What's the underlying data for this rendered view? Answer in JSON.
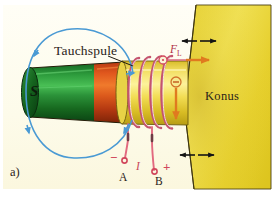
{
  "figure": {
    "panel_label": "a)",
    "background_color": "#fdfcf0",
    "page_color": "#ffffff",
    "caption_text": "Tauchspule im Konus eines Lautsprechers"
  },
  "labels": {
    "coil": "Tauchspule",
    "cone": "Konus",
    "terminal_a": "A",
    "terminal_b": "B",
    "terminal_a_sign": "−",
    "terminal_b_sign": "+",
    "current": "I",
    "force": "F",
    "force_subscript": "L",
    "magnet_pole": "S"
  },
  "colors": {
    "background": "#fdfcf0",
    "cone_yellow": "#ecd834",
    "tube_yellow": "#f0dd55",
    "magnet_green": "#1d7a2c",
    "magnet_green_dark": "#0d4f1a",
    "magnet_red": "#d94a1a",
    "coil_wire": "#d6607a",
    "lead_wire": "#e2697f",
    "field_line_blue": "#4a9ad4",
    "force_arrow_orange": "#e07a1f",
    "force_label_red": "#b13146",
    "motion_arrow_black": "#1a1a1a",
    "text_dark": "#2a2218"
  },
  "symbols": {
    "current_out_of_plane": "⊙",
    "current_into_plane": "⊖",
    "field_arrow": "arrowhead"
  },
  "annotations": {
    "field_loop_name": "magnetic-field-line-loop",
    "force_arrow_name": "lorentz-force-arrow",
    "down_arrow_name": "downward-force-arrow",
    "cone-motion-top": "cone-oscillation-arrows-top",
    "cone-motion-bottom": "cone-oscillation-arrows-bottom"
  }
}
